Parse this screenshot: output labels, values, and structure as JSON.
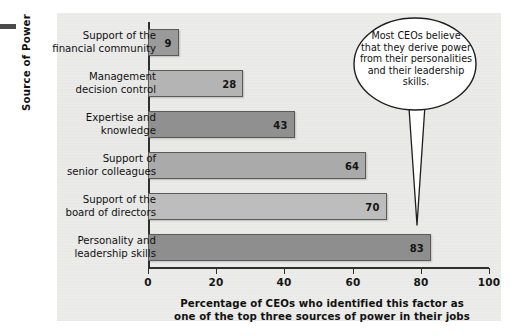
{
  "chart_data": {
    "type": "bar",
    "orientation": "horizontal",
    "title": "",
    "categories": [
      "Support of the\nfinancial community",
      "Management\ndecision control",
      "Expertise and\nknowledge",
      "Support of\nsenior colleagues",
      "Support of the\nboard of directors",
      "Personality and\nleadership skills"
    ],
    "values": [
      9,
      28,
      43,
      64,
      70,
      83
    ],
    "bar_colors": [
      "#9a9a9a",
      "#b4b4b4",
      "#909090",
      "#aaaaaa",
      "#bdbdbd",
      "#8e8e8e"
    ],
    "xlabel": "Percentage of CEOs who identified this factor as one of the top three sources of power in their jobs",
    "ylabel": "Source of Power",
    "xlim": [
      0,
      100
    ],
    "xticks": [
      0,
      20,
      40,
      60,
      80,
      100
    ],
    "xticklabels": [
      "0",
      "20",
      "40",
      "60",
      "80",
      "100"
    ],
    "grid": false,
    "legend": false,
    "data_labels": [
      "9",
      "28",
      "43",
      "64",
      "70",
      "83"
    ],
    "annotations": [
      {
        "type": "callout",
        "text": "Most CEOs believe that they derive power from their personalities and their leadership skills.",
        "points_to": "Personality and leadership skills"
      }
    ]
  },
  "chart": {
    "categories": [
      {
        "line1": "Support of the",
        "line2": "financial community",
        "value": 9,
        "label": "9"
      },
      {
        "line1": "Management",
        "line2": "decision control",
        "value": 28,
        "label": "28"
      },
      {
        "line1": "Expertise and",
        "line2": "knowledge",
        "value": 43,
        "label": "43"
      },
      {
        "line1": "Support of",
        "line2": "senior colleagues",
        "value": 64,
        "label": "64"
      },
      {
        "line1": "Support of the",
        "line2": "board of directors",
        "value": 70,
        "label": "70"
      },
      {
        "line1": "Personality and",
        "line2": "leadership skills",
        "value": 83,
        "label": "83"
      }
    ],
    "y_axis_title": "Source of Power",
    "x_axis_title_line1": "Percentage of CEOs who identified this factor as",
    "x_axis_title_line2": "one of the top three sources of power in their jobs",
    "x_tick_labels": [
      "0",
      "20",
      "40",
      "60",
      "80",
      "100"
    ]
  },
  "callout": {
    "line1": "Most CEOs believe",
    "line2": "that they derive power",
    "line3": "from their personalities",
    "line4": "and their leadership",
    "line5": "skills."
  },
  "colors": {
    "page_background": "#ebebea",
    "axis": "#2f2f2f",
    "text": "#111111",
    "bubble_fill": "#ffffff",
    "bubble_stroke": "#1e1e1e"
  }
}
